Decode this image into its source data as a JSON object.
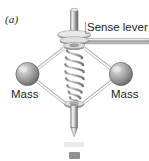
{
  "figure": {
    "panel_label": "(a)",
    "background_color": "#ffffff",
    "width": 149,
    "height": 161
  },
  "callouts": [
    {
      "id": "sense-lever",
      "label": "Sense lever",
      "text_color": "#231f20",
      "leader": "horizontal bar extending right from the disc hub"
    },
    {
      "id": "mass-left",
      "label": "Mass",
      "text_color": "#231f20",
      "leader": "left sphere"
    },
    {
      "id": "mass-right",
      "label": "Mass",
      "text_color": "#231f20",
      "leader": "right sphere"
    }
  ],
  "parts": {
    "top_rod": {
      "name": "upper vertical rod",
      "color_light": "#e6e6e6",
      "color_mid": "#9c9c9c",
      "color_dark": "#6b6b6b"
    },
    "disc_stack": {
      "name": "washer disc stack",
      "count": 3,
      "color_light": "#ededed",
      "color_dark": "#8a8a8a"
    },
    "coil_spring": {
      "name": "tapered coil spring",
      "turns": 9,
      "color_light": "#efefef",
      "color_dark": "#7a7a7a"
    },
    "mass_sphere_left": {
      "name": "left mass sphere",
      "fill_light": "#dcdcdc",
      "fill_dark": "#6d6d6d"
    },
    "mass_sphere_right": {
      "name": "right mass sphere",
      "fill_light": "#dcdcdc",
      "fill_dark": "#6d6d6d"
    },
    "linkage_arms": {
      "name": "pivoted linkage arms",
      "count": 4,
      "color_light": "#f2f2f2",
      "color_dark": "#7d7d7d"
    },
    "lower_collar": {
      "name": "lower collar nut",
      "color_light": "#e9e9e9",
      "color_dark": "#808080"
    },
    "bottom_shaft": {
      "name": "lower pointed shaft",
      "color_light": "#e3e3e3",
      "color_dark": "#6f6f6f"
    }
  },
  "next_panel_fragment": {
    "name": "top edge of following figure panel",
    "color": "#6e6e6e"
  }
}
